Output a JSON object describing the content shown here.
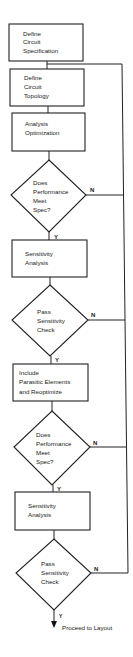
{
  "diagram": {
    "type": "flowchart",
    "colors": {
      "stroke": "#222222",
      "background": "#ffffff",
      "text": "#1a1a1a"
    },
    "nodes": [
      {
        "id": "n1",
        "kind": "process",
        "lines": [
          "Define",
          "Circuit",
          "Specification"
        ]
      },
      {
        "id": "n2",
        "kind": "process",
        "lines": [
          "Define",
          "Circuit",
          "Topology"
        ]
      },
      {
        "id": "n3",
        "kind": "process",
        "lines": [
          "Analysis",
          "Optimization"
        ]
      },
      {
        "id": "d1",
        "kind": "decision",
        "lines": [
          "Does",
          "Performance",
          "Meet",
          "Spec?"
        ]
      },
      {
        "id": "n4",
        "kind": "process",
        "lines": [
          "Sensitivity",
          "Analysis"
        ]
      },
      {
        "id": "d2",
        "kind": "decision",
        "lines": [
          "Pass",
          "Sensitivity",
          "Check"
        ]
      },
      {
        "id": "n5",
        "kind": "process",
        "lines": [
          "Include",
          "Parasitic Elements",
          "and Reoptimize"
        ]
      },
      {
        "id": "d3",
        "kind": "decision",
        "lines": [
          "Does",
          "Performance",
          "Meet",
          "Spec?"
        ]
      },
      {
        "id": "n6",
        "kind": "process",
        "lines": [
          "Sensitivity",
          "Analysis"
        ]
      },
      {
        "id": "d4",
        "kind": "decision",
        "lines": [
          "Pass",
          "Sensitivity",
          "Check"
        ]
      }
    ],
    "edge_labels": {
      "yes": "Y",
      "no": "N"
    },
    "terminal_label": "Proceed to Layout",
    "edges": [
      {
        "from": "n1",
        "to": "n2"
      },
      {
        "from": "n2",
        "to": "n3"
      },
      {
        "from": "n3",
        "to": "d1"
      },
      {
        "from": "d1",
        "to": "n4",
        "label": "Y"
      },
      {
        "from": "d1",
        "to": "n2",
        "label": "N"
      },
      {
        "from": "n4",
        "to": "d2"
      },
      {
        "from": "d2",
        "to": "n5",
        "label": "Y"
      },
      {
        "from": "d2",
        "to": "n2",
        "label": "N"
      },
      {
        "from": "n5",
        "to": "d3"
      },
      {
        "from": "d3",
        "to": "n6",
        "label": "Y"
      },
      {
        "from": "d3",
        "to": "n2",
        "label": "N"
      },
      {
        "from": "n6",
        "to": "d4"
      },
      {
        "from": "d4",
        "to": "end",
        "label": "Y"
      },
      {
        "from": "d4",
        "to": "n2",
        "label": "N"
      }
    ]
  }
}
